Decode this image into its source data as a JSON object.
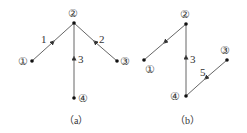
{
  "diagrams": [
    {
      "id": "a",
      "caption": "（a）",
      "nodes": [
        {
          "id": "1",
          "label": "①",
          "x": 32,
          "y": 61
        },
        {
          "id": "2",
          "label": "②",
          "x": 74,
          "y": 23
        },
        {
          "id": "3",
          "label": "③",
          "x": 117,
          "y": 61
        },
        {
          "id": "4",
          "label": "④",
          "x": 74,
          "y": 98
        }
      ],
      "edges": [
        {
          "from": "1",
          "to": "2",
          "label": "1"
        },
        {
          "from": "3",
          "to": "2",
          "label": "2"
        },
        {
          "from": "4",
          "to": "2",
          "label": "3"
        }
      ]
    },
    {
      "id": "b",
      "caption": "（b）",
      "nodes": [
        {
          "id": "1",
          "label": "①",
          "x": 144,
          "y": 60
        },
        {
          "id": "2",
          "label": "②",
          "x": 186,
          "y": 24
        },
        {
          "id": "3",
          "label": "③",
          "x": 227,
          "y": 60
        },
        {
          "id": "4",
          "label": "④",
          "x": 186,
          "y": 96
        }
      ],
      "edges": [
        {
          "from": "2",
          "to": "1",
          "label": ""
        },
        {
          "from": "4",
          "to": "2",
          "label": "3"
        },
        {
          "from": "3",
          "to": "4",
          "label": "5"
        }
      ]
    }
  ],
  "colors": {
    "line": "#555555",
    "node": "#111111"
  }
}
